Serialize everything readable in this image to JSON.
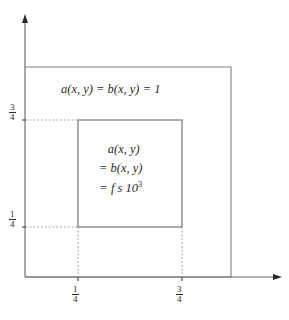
{
  "figure": {
    "name": "piecewise-coefficient-domain-diagram",
    "background_color": "#ffffff",
    "line_color": "#808080",
    "text_color": "#2b2b2b"
  },
  "axes": {
    "x_axis_name": "x-axis",
    "y_axis_name": "y-axis",
    "x_ticks": [
      {
        "id": "x-1-4",
        "numerator": "1",
        "denominator": "4",
        "value": 0.25
      },
      {
        "id": "x-3-4",
        "numerator": "3",
        "denominator": "4",
        "value": 0.75
      }
    ],
    "y_ticks": [
      {
        "id": "y-3-4",
        "numerator": "3",
        "denominator": "4",
        "value": 0.75
      },
      {
        "id": "y-1-4",
        "numerator": "1",
        "denominator": "4",
        "value": 0.25
      }
    ]
  },
  "regions": {
    "outer": {
      "label_line1": "a(x, y) = b(x, y) = 1"
    },
    "inner": {
      "label_line1": "a(x, y)",
      "label_line2": "= b(x, y)",
      "label_line3_prefix": "= f s 10",
      "label_line3_exponent": "3"
    }
  }
}
